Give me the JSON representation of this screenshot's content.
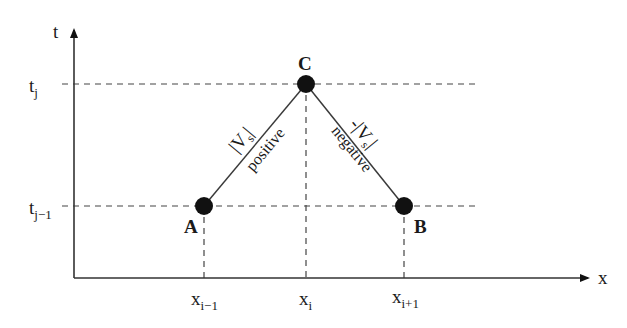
{
  "diagram": {
    "type": "space-time characteristic diagram",
    "axes": {
      "x_label": "x",
      "t_label": "t",
      "x_ticks": [
        {
          "base": "x",
          "sub": "i−1"
        },
        {
          "base": "x",
          "sub": "i"
        },
        {
          "base": "x",
          "sub": "i+1"
        }
      ],
      "t_ticks": [
        {
          "base": "t",
          "sub": "j"
        },
        {
          "base": "t",
          "sub": "j−1"
        }
      ]
    },
    "points": [
      {
        "id": "A",
        "label": "A"
      },
      {
        "id": "C",
        "label": "C"
      },
      {
        "id": "B",
        "label": "B"
      }
    ],
    "edges": [
      {
        "from": "A",
        "to": "C",
        "speed_label": "|V",
        "speed_sub": "s",
        "speed_close": "|",
        "sign_label": "positive"
      },
      {
        "from": "C",
        "to": "B",
        "speed_label": "-|V",
        "speed_sub": "s",
        "speed_close": "|",
        "sign_label": "negative"
      }
    ],
    "colors": {
      "line": "#3a3a3a",
      "dot": "#111111",
      "dash": "#444444"
    }
  }
}
